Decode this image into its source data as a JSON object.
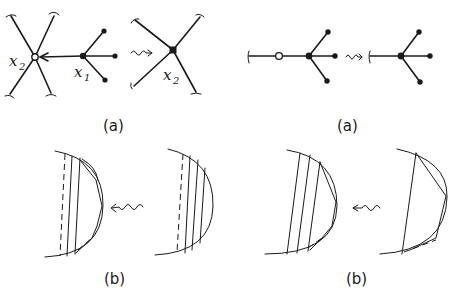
{
  "panels": {
    "top_left": {
      "caption": "(a)",
      "labels": {
        "x2_left": "x",
        "x2_left_sub": "2",
        "x1": "x",
        "x1_sub": "1",
        "x2_right": "x",
        "x2_right_sub": "2"
      },
      "description": "Star graph with open vertex x2 and edge contracted from x1 becomes single vertex x2"
    },
    "top_right": {
      "caption": "(a)",
      "description": "Path with open vertex contracted into trivalent node"
    },
    "bottom_left": {
      "caption": "(b)",
      "description": "Half-disc with inscribed polygon and hatching, arrow from hatched half-disc"
    },
    "bottom_right": {
      "caption": "(b)",
      "description": "Half-disc with multiple chords and inscribed polygon, arrow from single chord half-disc"
    }
  }
}
